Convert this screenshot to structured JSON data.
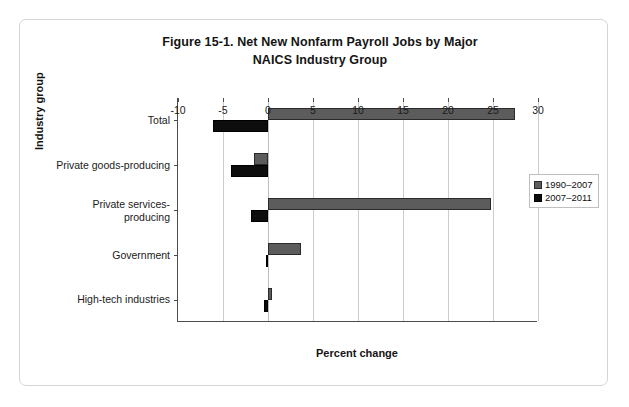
{
  "figure": {
    "title_line1": "Figure 15-1. Net New Nonfarm Payroll Jobs by Major",
    "title_line2": "NAICS Industry Group"
  },
  "axes": {
    "xlabel": "Percent change",
    "ylabel": "Industry group",
    "xticks": [
      "-10",
      "-5",
      "0",
      "5",
      "10",
      "15",
      "20",
      "25",
      "30"
    ]
  },
  "legend": {
    "entries": [
      {
        "label": "1990–2007",
        "color": "#5c5c5c"
      },
      {
        "label": "2007–2011",
        "color": "#0d0d0d"
      }
    ]
  },
  "chart_data": {
    "type": "bar",
    "orientation": "horizontal",
    "title": "Figure 15-1. Net New Nonfarm Payroll Jobs by Major NAICS Industry Group",
    "xlabel": "Percent change",
    "ylabel": "Industry group",
    "xlim": [
      -10,
      30
    ],
    "xtick_step": 5,
    "grid": "vertical",
    "legend_position": "right",
    "categories": [
      "Total",
      "Private goods-producing",
      "Private services-producing",
      "Government",
      "High-tech industries"
    ],
    "category_labels": [
      [
        "Total"
      ],
      [
        "Private goods-producing"
      ],
      [
        "Private services-",
        "producing"
      ],
      [
        "Government"
      ],
      [
        "High-tech industries"
      ]
    ],
    "series": [
      {
        "name": "1990–2007",
        "color": "#5c5c5c",
        "values": [
          27.4,
          -1.6,
          24.8,
          3.7,
          0.4
        ]
      },
      {
        "name": "2007–2011",
        "color": "#0d0d0d",
        "values": [
          -6.1,
          -4.1,
          -1.9,
          -0.2,
          -0.4
        ]
      }
    ]
  }
}
